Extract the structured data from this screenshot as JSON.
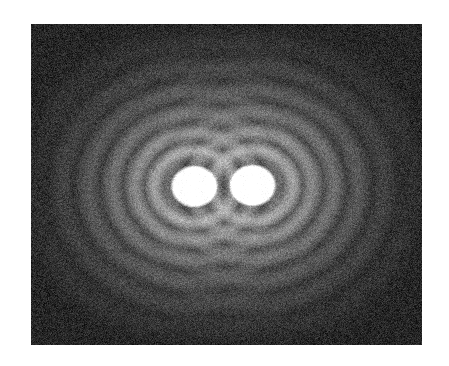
{
  "page": {
    "background_color": "#ffffff",
    "width": 449,
    "height": 366
  },
  "figure": {
    "name": "two-lobe-interference-pattern",
    "panel": {
      "x": 31,
      "y": 24,
      "width": 391,
      "height": 321,
      "background_color": "#232323",
      "border_color": "#ffffff"
    }
  },
  "chart_data": {
    "type": "heatmap",
    "title": "",
    "subtitle": "",
    "xlabel": "",
    "ylabel": "",
    "grid": false,
    "legend": "none",
    "colormap": "grayscale",
    "value_range": [
      0,
      255
    ],
    "background_level": 38,
    "noise_amplitude": 26,
    "xlim": [
      0,
      391
    ],
    "ylim": [
      0,
      321
    ],
    "sources": [
      {
        "name": "left-lobe",
        "cx": 163,
        "cy": 162,
        "core_radius": 23,
        "peak_level": 255
      },
      {
        "name": "right-lobe",
        "cx": 221,
        "cy": 161,
        "core_radius": 23,
        "peak_level": 255
      }
    ],
    "fringes": [
      {
        "index": 1,
        "radius": 40,
        "peak_level": 150,
        "width": 9
      },
      {
        "index": 2,
        "radius": 60,
        "peak_level": 128,
        "width": 10
      },
      {
        "index": 3,
        "radius": 82,
        "peak_level": 104,
        "width": 11
      },
      {
        "index": 4,
        "radius": 106,
        "peak_level": 84,
        "width": 12
      },
      {
        "index": 5,
        "radius": 132,
        "peak_level": 66,
        "width": 13
      },
      {
        "index": 6,
        "radius": 160,
        "peak_level": 52,
        "width": 14
      }
    ],
    "dark_rings": [
      {
        "index": 1,
        "radius": 30,
        "level": 30
      },
      {
        "index": 2,
        "radius": 50,
        "level": 30
      },
      {
        "index": 3,
        "radius": 71,
        "level": 30
      },
      {
        "index": 4,
        "radius": 94,
        "level": 30
      },
      {
        "index": 5,
        "radius": 119,
        "level": 30
      },
      {
        "index": 6,
        "radius": 146,
        "level": 30
      }
    ],
    "vertical_compression": 1.12
  }
}
